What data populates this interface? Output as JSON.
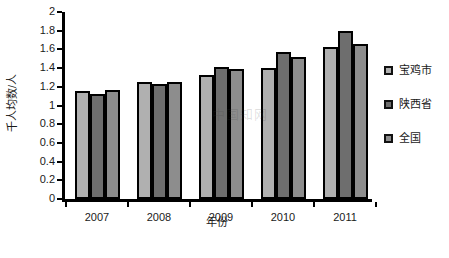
{
  "chart_data": {
    "type": "bar",
    "title": "",
    "xlabel": "年份",
    "ylabel": "千人均数/人",
    "categories": [
      "2007",
      "2008",
      "2009",
      "2010",
      "2011"
    ],
    "series": [
      {
        "name": "宝鸡市",
        "color": "#b0b0b0",
        "values": [
          1.15,
          1.25,
          1.33,
          1.4,
          1.63
        ]
      },
      {
        "name": "陕西省",
        "color": "#6e6e6e",
        "values": [
          1.12,
          1.23,
          1.41,
          1.57,
          1.8
        ]
      },
      {
        "name": "全国",
        "color": "#8d8d8d",
        "values": [
          1.17,
          1.25,
          1.39,
          1.52,
          1.66
        ]
      }
    ],
    "ylim": [
      0,
      2
    ],
    "ytick_step": 0.2,
    "yticks": [
      "0",
      "0.2",
      "0.4",
      "0.6",
      "0.8",
      "1",
      "1.2",
      "1.4",
      "1.6",
      "1.8",
      "2"
    ],
    "grid": false,
    "legend_position": "right"
  },
  "legend": {
    "items": [
      {
        "label": "宝鸡市"
      },
      {
        "label": "陕西省"
      },
      {
        "label": "全国"
      }
    ]
  },
  "axes": {
    "y_title": "千人均数/人",
    "x_title": "年份"
  },
  "watermark": {
    "text": "中国知网"
  },
  "caption": {
    "text": ""
  }
}
